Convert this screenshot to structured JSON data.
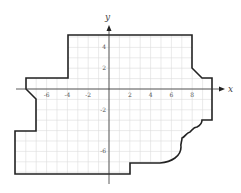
{
  "diagram": {
    "type": "coordinate-plane-polygon",
    "axes": {
      "x_label": "x",
      "y_label": "y",
      "x_ticks": [
        {
          "value": -6,
          "label": "-6"
        },
        {
          "value": -4,
          "label": "-4"
        },
        {
          "value": -2,
          "label": "-2"
        },
        {
          "value": 2,
          "label": "2"
        },
        {
          "value": 4,
          "label": "4"
        },
        {
          "value": 6,
          "label": "6"
        },
        {
          "value": 8,
          "label": "8"
        }
      ],
      "y_ticks": [
        {
          "value": 4,
          "label": "4"
        },
        {
          "value": 2,
          "label": "2"
        },
        {
          "value": -2,
          "label": "-2"
        },
        {
          "value": -6,
          "label": "-6"
        }
      ],
      "grid_step": 1
    },
    "shape_outline_color": "#222222",
    "grid_color": "#d9d9d9",
    "axis_color": "#333333"
  }
}
